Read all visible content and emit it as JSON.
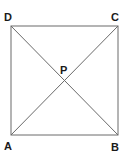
{
  "diagram": {
    "vertices": {
      "A": {
        "label": "A",
        "x": 11,
        "y": 135
      },
      "B": {
        "label": "B",
        "x": 118,
        "y": 135
      },
      "C": {
        "label": "C",
        "x": 118,
        "y": 26
      },
      "D": {
        "label": "D",
        "x": 11,
        "y": 26
      }
    },
    "intersection": {
      "label": "P",
      "x": 64.5,
      "y": 80.5
    },
    "edges": [
      "AB",
      "BC",
      "CD",
      "DA"
    ],
    "diagonals": [
      "AC",
      "BD"
    ],
    "colors": {
      "line": "#6a6a6a",
      "text": "#1a1a1a",
      "background": "#ffffff"
    }
  }
}
